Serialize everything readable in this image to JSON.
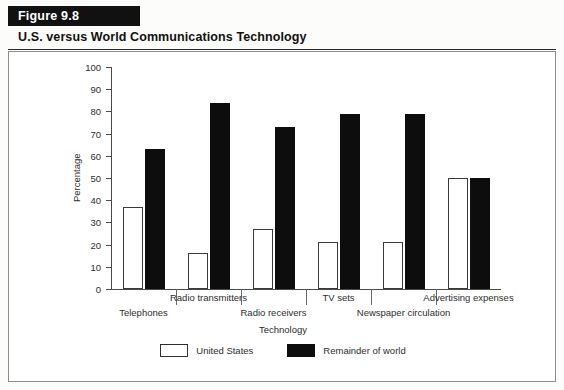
{
  "figure": {
    "band_label": "Figure 9.8",
    "title": "U.S. versus World Communications Technology"
  },
  "colors": {
    "band_background": "#111111",
    "band_text": "#ffffff",
    "series_us": "#ffffff",
    "series_world": "#0d0d0d",
    "axis": "#4a4a4a",
    "frame": "#8d8d8d"
  },
  "chart_data": {
    "type": "bar",
    "title": "U.S. versus World Communications Technology",
    "xlabel": "Technology",
    "ylabel": "Percentage",
    "ylim": [
      0,
      100
    ],
    "yticks": [
      0,
      10,
      20,
      30,
      40,
      50,
      60,
      70,
      80,
      90,
      100
    ],
    "grid": false,
    "legend_position": "bottom",
    "categories": [
      "Telephones",
      "Radio transmitters",
      "Radio receivers",
      "TV sets",
      "Newspaper circulation",
      "Advertising expenses"
    ],
    "series": [
      {
        "name": "United States",
        "values": [
          37,
          16,
          27,
          21,
          21,
          50
        ]
      },
      {
        "name": "Remainder of world",
        "values": [
          63,
          84,
          73,
          79,
          79,
          50
        ]
      }
    ]
  }
}
